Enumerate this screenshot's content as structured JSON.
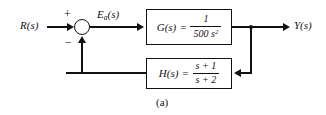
{
  "figure": {
    "caption": "(a)",
    "type": "control-system-block-diagram",
    "background_color": "#ffffff",
    "line_color": "#111111"
  },
  "signals": {
    "input_label": "R(s)",
    "error_label_base": "E",
    "error_label_sub": "a",
    "error_label_tail": "(s)",
    "output_label": "Y(s)"
  },
  "summing_junction": {
    "name": "summing-junction",
    "positive_sign": "+",
    "negative_sign": "−"
  },
  "blocks": [
    {
      "id": "forward-path",
      "name": "G(s)",
      "equals": "=",
      "numerator": "1",
      "denominator": "500 s",
      "denominator_exponent": "2"
    },
    {
      "id": "feedback-path",
      "name": "H(s)",
      "equals": "=",
      "numerator": "s + 1",
      "denominator": "s + 2",
      "denominator_exponent": ""
    }
  ]
}
